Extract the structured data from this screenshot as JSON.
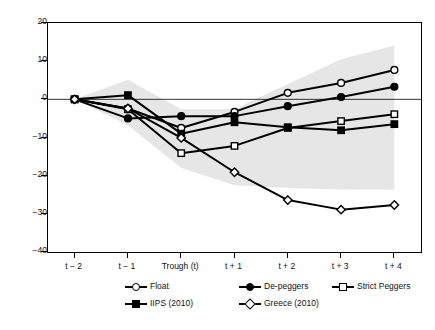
{
  "chart_data": {
    "type": "line",
    "title": "",
    "subtitle": "",
    "xlabel": "",
    "ylabel": "",
    "categories": [
      "t − 2",
      "t − 1",
      "Trough (t)",
      "t + 1",
      "t + 2",
      "t + 3",
      "t + 4"
    ],
    "ylim": [
      -40,
      20
    ],
    "yticks": [
      20,
      10,
      0,
      -10,
      -20,
      -30,
      -40
    ],
    "ytick_labels": [
      "20",
      "10",
      "0",
      "−10",
      "−20",
      "−30",
      "−40"
    ],
    "grid": false,
    "zero_line": true,
    "legend_position": "bottom",
    "series": [
      {
        "name": "Float",
        "marker": "open-circle",
        "values": [
          0,
          -2.4,
          -7.5,
          -3.3,
          1.7,
          4.3,
          7.7
        ]
      },
      {
        "name": "De-peggers",
        "marker": "filled-circle",
        "values": [
          0,
          -5.0,
          -4.4,
          -4.4,
          -1.8,
          0.6,
          3.3
        ]
      },
      {
        "name": "Strict Peggers",
        "marker": "open-square",
        "values": [
          0,
          -2.6,
          -14.1,
          -12.2,
          -7.5,
          -5.7,
          -3.9
        ]
      },
      {
        "name": "IIPS (2010)",
        "marker": "filled-square",
        "values": [
          0,
          1.1,
          -9.0,
          -6.0,
          -7.3,
          -8.1,
          -6.5
        ]
      },
      {
        "name": "Greece (2010)",
        "marker": "open-diamond",
        "values": [
          0,
          -2.4,
          -10.1,
          -19.1,
          -26.4,
          -28.9,
          -27.7
        ]
      }
    ],
    "band": {
      "name": "confidence-band",
      "color": "#e6e6e6",
      "upper": [
        0,
        5.1,
        -2.6,
        -2.6,
        4.0,
        10.5,
        14.1
      ],
      "lower": [
        0,
        -6.8,
        -18.0,
        -22.5,
        -23.2,
        -23.6,
        -23.7
      ]
    }
  },
  "legend": {
    "rows": [
      [
        {
          "label": "Float",
          "marker": "open-circle"
        },
        {
          "label": "De-peggers",
          "marker": "filled-circle"
        },
        {
          "label": "Strict Peggers",
          "marker": "open-square"
        }
      ],
      [
        {
          "label": "IIPS (2010)",
          "marker": "filled-square"
        },
        {
          "label": "Greece (2010)",
          "marker": "open-diamond"
        }
      ]
    ]
  },
  "colors": {
    "line": "#000000",
    "band": "#e6e6e6",
    "axis": "#000000",
    "text": "#111111",
    "background": "#ffffff"
  }
}
